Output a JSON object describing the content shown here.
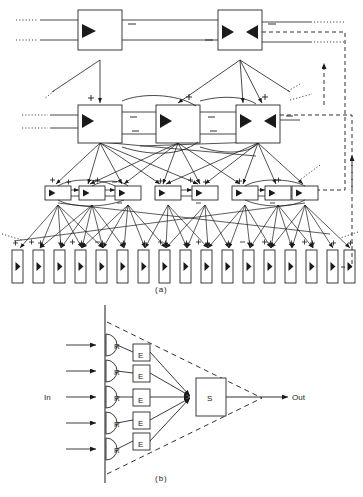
{
  "figure": {
    "panels": [
      {
        "id": "a",
        "caption": "(a)",
        "description": "Multi-level hierarchy of processing modules with lateral inhibitory links and dashed global feedback paths",
        "levels": [
          {
            "name": "level-4-top",
            "role": "top-level modules",
            "count": 2,
            "module_glyph": "triangle-amplifier",
            "modules": [
              {
                "label": "",
                "glyph": "triangle-right",
                "x": 97,
                "y": 28
              },
              {
                "label": "",
                "glyph": "triangle-pair-opposed",
                "x": 240,
                "y": 28
              }
            ]
          },
          {
            "name": "level-3-middle",
            "role": "intermediate modules",
            "count": 3,
            "modules": [
              {
                "label": "",
                "glyph": "triangle-right",
                "x": 97,
                "y": 118
              },
              {
                "label": "",
                "glyph": "triangle-right",
                "x": 175,
                "y": 118
              },
              {
                "label": "",
                "glyph": "triangle-pair-opposed",
                "x": 255,
                "y": 118
              }
            ]
          },
          {
            "name": "level-2-small",
            "role": "local processing cells",
            "clusters": [
              3,
              2,
              3
            ],
            "count": 8
          },
          {
            "name": "level-1-receptors",
            "role": "sensor/receptor elements",
            "count": 17,
            "glyph": "triangle-right"
          }
        ],
        "signs": {
          "excitatory": "+",
          "inhibitory": "−",
          "excitatory_count": 30,
          "inhibitory_count": 14
        },
        "feedback": {
          "style": "dashed",
          "loops": 2,
          "arrow": "up"
        },
        "edge_style": {
          "solid": "forward connections",
          "dotted": "truncated / continuing connections"
        }
      },
      {
        "id": "b",
        "caption": "(b)",
        "description": "Receptive field funnel: receptors R feed encoders E which converge on summing unit S",
        "input_label": "In",
        "output_label": "Out",
        "input_arrows": 5,
        "nodes": {
          "receptors": [
            {
              "label": "R"
            },
            {
              "label": "R"
            },
            {
              "label": "R"
            },
            {
              "label": "R"
            },
            {
              "label": "R"
            }
          ],
          "encoders": [
            {
              "label": "E"
            },
            {
              "label": "E"
            },
            {
              "label": "E"
            },
            {
              "label": "E"
            },
            {
              "label": "E"
            }
          ],
          "summer": {
            "label": "S"
          }
        },
        "envelope": {
          "style": "dashed",
          "shape": "cone"
        }
      }
    ]
  },
  "colors": {
    "ink": "#1a1a1a",
    "line": "#2b2b2b",
    "fill": "#ffffff",
    "background": "#ffffff"
  }
}
